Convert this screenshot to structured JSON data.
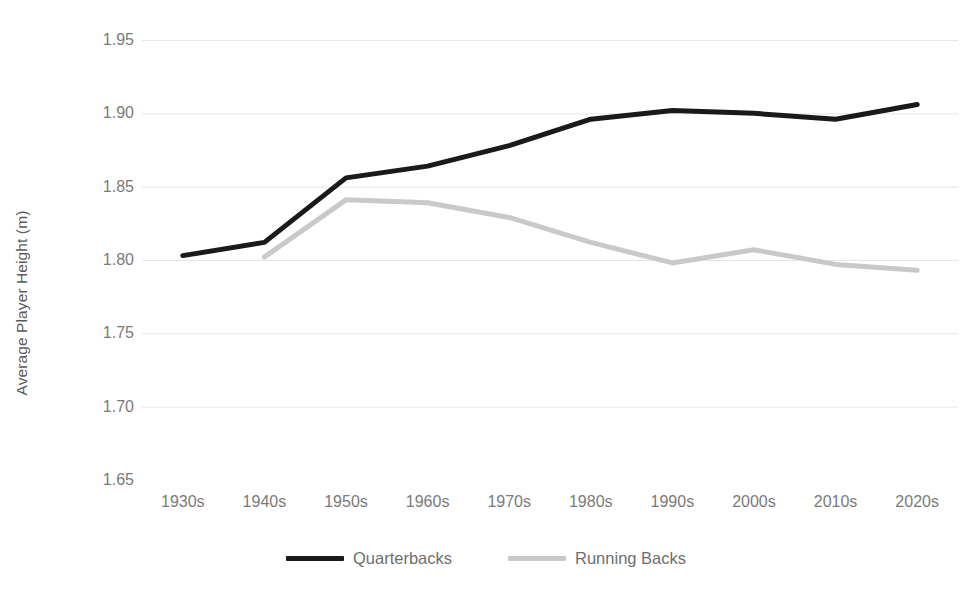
{
  "chart_data": {
    "type": "line",
    "title": "",
    "subtitle": "",
    "xlabel": "",
    "ylabel": "Average Player Height (m)",
    "categories": [
      "1930s",
      "1940s",
      "1950s",
      "1960s",
      "1970s",
      "1980s",
      "1990s",
      "2000s",
      "2010s",
      "2020s"
    ],
    "series": [
      {
        "name": "Quarterbacks",
        "color": "#1a1a1a",
        "values": [
          1.803,
          1.812,
          1.856,
          1.864,
          1.878,
          1.896,
          1.902,
          1.9,
          1.896,
          1.906
        ]
      },
      {
        "name": "Running Backs",
        "color": "#c9c9c9",
        "values": [
          null,
          1.802,
          1.841,
          1.839,
          1.829,
          1.812,
          1.798,
          1.807,
          1.797,
          1.793
        ]
      }
    ],
    "ylim": [
      1.65,
      1.95
    ],
    "ytick_values": [
      1.95,
      1.9,
      1.85,
      1.8,
      1.75,
      1.7,
      1.65
    ],
    "ytick_labels": [
      "1.95",
      "1.90",
      "1.85",
      "1.80",
      "1.75",
      "1.70",
      "1.65"
    ],
    "grid": "horizontal",
    "grid_color": "#e6e6e6",
    "legend_position": "bottom",
    "background": "#ffffff"
  },
  "legend": {
    "items": [
      {
        "label": "Quarterbacks",
        "color": "#1a1a1a"
      },
      {
        "label": "Running Backs",
        "color": "#c9c9c9"
      }
    ]
  }
}
